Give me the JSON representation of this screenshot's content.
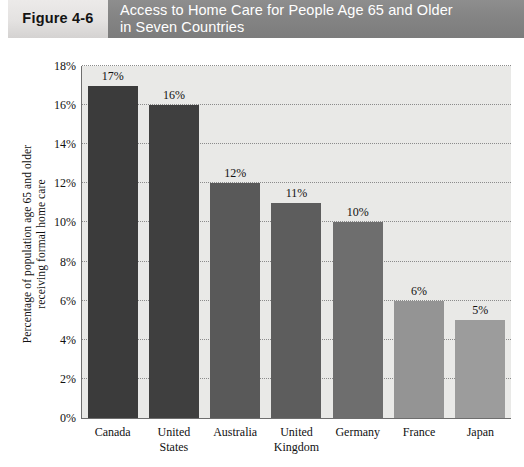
{
  "header": {
    "figure_label": "Figure 4-6",
    "title_lines": [
      "Access to Home Care for People Age 65 and Older",
      "in Seven Countries"
    ],
    "title_bar_color": "#858585",
    "figure_box_color": "#e4e2e1"
  },
  "chart_data": {
    "type": "bar",
    "title": "Access to Home Care for People Age 65 and Older in Seven Countries",
    "categories": [
      "Canada",
      "United States",
      "Australia",
      "United Kingdom",
      "Germany",
      "France",
      "Japan"
    ],
    "category_lines": [
      [
        "Canada"
      ],
      [
        "United",
        "States"
      ],
      [
        "Australia"
      ],
      [
        "United",
        "Kingdom"
      ],
      [
        "Germany"
      ],
      [
        "France"
      ],
      [
        "Japan"
      ]
    ],
    "values": [
      17,
      16,
      12,
      11,
      10,
      6,
      5
    ],
    "data_labels": [
      "17%",
      "16%",
      "12%",
      "11%",
      "10%",
      "6%",
      "5%"
    ],
    "bar_colors": [
      "#3b3b3b",
      "#3f3f3f",
      "#595959",
      "#5d5d5d",
      "#6e6e6e",
      "#949494",
      "#9c9c9c"
    ],
    "xlabel": "",
    "ylabel": "Percentage of population age 65 and older receiving formal home care",
    "ylabel_lines": [
      "Percentage of population age 65 and older",
      "receiving formal home care"
    ],
    "ylim": [
      0,
      18
    ],
    "ytick_values": [
      0,
      2,
      4,
      6,
      8,
      10,
      12,
      14,
      16,
      18
    ],
    "ytick_labels": [
      "0%",
      "2%",
      "4%",
      "6%",
      "8%",
      "10%",
      "12%",
      "14%",
      "16%",
      "18%"
    ],
    "grid": true,
    "grid_style": "dotted",
    "grid_color": "#8b8b8b",
    "plot_background": "#e9e9e7",
    "axis_color": "#6e6e6e",
    "legend": null,
    "legend_position": "none"
  }
}
